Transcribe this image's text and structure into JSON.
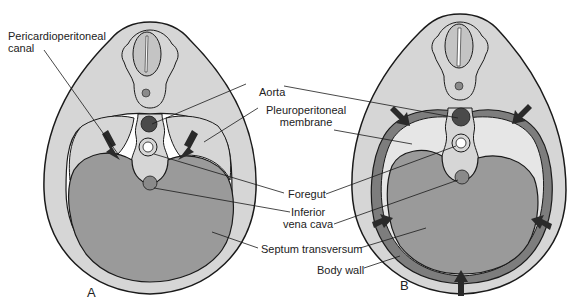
{
  "figure": {
    "panels": [
      {
        "letter": "A",
        "description": "Pericardioperitoneal canals open; pleuroperitoneal membranes beginning to grow"
      },
      {
        "letter": "B",
        "description": "Pleuroperitoneal membranes extending; body wall contributing"
      }
    ],
    "labels": {
      "pericardioperitoneal_line1": "Pericardioperitoneal",
      "pericardioperitoneal_line2": "canal",
      "aorta": "Aorta",
      "pleuroperitoneal_line1": "Pleuroperitoneal",
      "pleuroperitoneal_line2": "membrane",
      "foregut": "Foregut",
      "ivc_line1": "Inferior",
      "ivc_line2": "vena cava",
      "septum": "Septum transversum",
      "body_wall": "Body wall"
    },
    "colors": {
      "body_fill": "#d6d6d6",
      "septum_fill": "#9a9a9a",
      "aorta_fill": "#4a4a4a",
      "membrane_band": "#7d7d7d",
      "arrow_fill": "#2a2a2a",
      "outline": "#1a1a1a",
      "white": "#ffffff"
    }
  }
}
